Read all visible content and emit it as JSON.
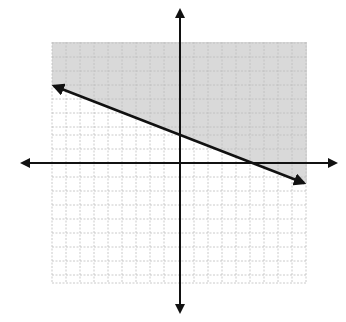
{
  "figure": {
    "type": "linear-inequality-graph",
    "grid": {
      "x_min": -9,
      "x_max": 9,
      "y_min": -9,
      "y_max": 9,
      "cell_px": 14,
      "origin_px": [
        180,
        163
      ],
      "grid_px_box": [
        52,
        42,
        307,
        283
      ]
    },
    "boundary_line": {
      "style": "solid",
      "slope": -0.375,
      "y_intercept": 2,
      "start_px": [
        54,
        86
      ],
      "end_px": [
        304,
        183
      ]
    },
    "shaded_region": "above line",
    "colors": {
      "shade": "#d9d9d9",
      "grid": "#bdbdbd",
      "axis": "#111111",
      "line": "#111111"
    }
  }
}
